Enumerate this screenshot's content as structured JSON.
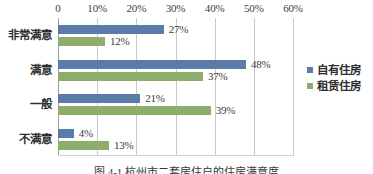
{
  "chart_data": {
    "type": "bar",
    "orientation": "horizontal",
    "title": "",
    "xlabel": "",
    "ylabel": "",
    "categories": [
      "非常满意",
      "满意",
      "一般",
      "不满意"
    ],
    "series": [
      {
        "name": "自有住房",
        "color": "#5b7ba8",
        "values": [
          27,
          48,
          21,
          4
        ],
        "labels": [
          "27%",
          "48%",
          "21%",
          "4%"
        ]
      },
      {
        "name": "租赁住房",
        "color": "#8cae6a",
        "values": [
          12,
          37,
          39,
          13
        ],
        "labels": [
          "12%",
          "37%",
          "39%",
          "13%"
        ]
      }
    ],
    "xlim": [
      0,
      60
    ],
    "xticks": [
      0,
      10,
      20,
      30,
      40,
      50,
      60
    ],
    "xtick_labels": [
      "0",
      "10%",
      "20%",
      "30%",
      "40%",
      "50%",
      "60%"
    ],
    "grid": true,
    "grid_axis": "x",
    "legend_position": "right",
    "axis_position": "top"
  },
  "legend": {
    "items": [
      {
        "label": "自有住房"
      },
      {
        "label": "租赁住房"
      }
    ]
  },
  "caption": {
    "text": "图 4-1  杭州市二套房住户的住房满意度"
  }
}
